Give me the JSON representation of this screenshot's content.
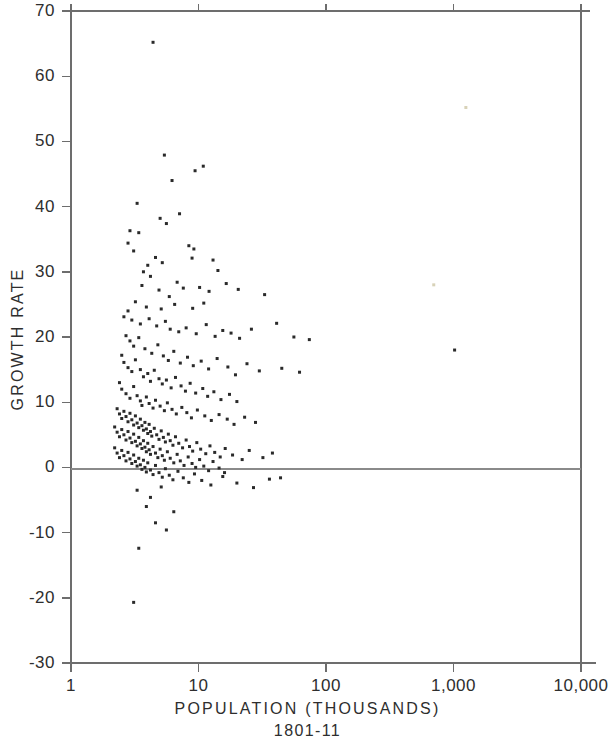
{
  "chart_data": {
    "type": "scatter",
    "title": "",
    "xlabel": "POPULATION  (THOUSANDS)",
    "xlabel_sub": "1801-11",
    "ylabel": "GROWTH  RATE",
    "x_scale": "log",
    "y_scale": "linear",
    "xlim": [
      1,
      10000
    ],
    "ylim": [
      -30,
      70
    ],
    "grid": false,
    "legend": null,
    "x_ticks": [
      1,
      10,
      100,
      1000,
      10000
    ],
    "x_tick_labels": [
      "1",
      "10",
      "100",
      "1,000",
      "10,000"
    ],
    "y_ticks": [
      -30,
      -20,
      -10,
      0,
      10,
      20,
      30,
      40,
      50,
      60,
      70
    ],
    "y_tick_labels": [
      "-30",
      "-20",
      "-10",
      "0",
      "10",
      "20",
      "30",
      "40",
      "50",
      "60",
      "70"
    ],
    "zero_reference_line": 0,
    "marker": "square-dot",
    "marker_size_px": 3,
    "marker_color": "#2a2a2a",
    "point_count": 268,
    "points": [
      [
        4.4,
        65.2
      ],
      [
        3.3,
        40.5
      ],
      [
        2.9,
        36.3
      ],
      [
        2.8,
        34.4
      ],
      [
        3.4,
        36.0
      ],
      [
        3.1,
        33.2
      ],
      [
        5.4,
        47.9
      ],
      [
        6.2,
        44.0
      ],
      [
        9.4,
        45.5
      ],
      [
        10.9,
        46.2
      ],
      [
        7.1,
        38.9
      ],
      [
        5.0,
        38.2
      ],
      [
        5.6,
        37.4
      ],
      [
        4.0,
        31.0
      ],
      [
        4.6,
        32.2
      ],
      [
        5.2,
        31.4
      ],
      [
        8.4,
        34.0
      ],
      [
        9.2,
        33.5
      ],
      [
        8.9,
        32.1
      ],
      [
        13.0,
        31.8
      ],
      [
        14.2,
        30.2
      ],
      [
        3.7,
        30.0
      ],
      [
        4.2,
        29.3
      ],
      [
        3.6,
        27.9
      ],
      [
        4.9,
        27.2
      ],
      [
        6.8,
        28.4
      ],
      [
        7.6,
        27.5
      ],
      [
        5.9,
        26.2
      ],
      [
        10.2,
        27.6
      ],
      [
        12.1,
        27.0
      ],
      [
        16.5,
        28.2
      ],
      [
        20.5,
        27.3
      ],
      [
        33.0,
        26.5
      ],
      [
        11.0,
        25.2
      ],
      [
        9.0,
        24.4
      ],
      [
        6.5,
        25.0
      ],
      [
        5.1,
        24.3
      ],
      [
        3.9,
        24.6
      ],
      [
        3.2,
        25.4
      ],
      [
        2.8,
        24.0
      ],
      [
        2.6,
        23.1
      ],
      [
        3.0,
        22.6
      ],
      [
        3.5,
        22.0
      ],
      [
        4.1,
        22.8
      ],
      [
        4.7,
        21.7
      ],
      [
        5.5,
        22.4
      ],
      [
        6.0,
        21.2
      ],
      [
        7.0,
        20.8
      ],
      [
        8.0,
        21.4
      ],
      [
        9.6,
        20.5
      ],
      [
        11.5,
        21.9
      ],
      [
        13.5,
        20.1
      ],
      [
        15.5,
        21.0
      ],
      [
        18.0,
        20.6
      ],
      [
        21.0,
        19.8
      ],
      [
        26.0,
        21.2
      ],
      [
        41.0,
        22.1
      ],
      [
        56.0,
        20.0
      ],
      [
        74.0,
        19.6
      ],
      [
        1020.0,
        18.0
      ],
      [
        2.7,
        20.2
      ],
      [
        2.9,
        19.4
      ],
      [
        3.1,
        18.6
      ],
      [
        3.4,
        19.9
      ],
      [
        3.8,
        18.2
      ],
      [
        4.3,
        17.5
      ],
      [
        4.8,
        18.8
      ],
      [
        5.3,
        17.1
      ],
      [
        5.8,
        16.4
      ],
      [
        6.4,
        17.8
      ],
      [
        7.2,
        16.0
      ],
      [
        8.2,
        16.9
      ],
      [
        9.1,
        15.6
      ],
      [
        10.5,
        16.3
      ],
      [
        12.0,
        15.1
      ],
      [
        14.0,
        16.7
      ],
      [
        17.0,
        15.4
      ],
      [
        19.5,
        14.2
      ],
      [
        24.0,
        15.9
      ],
      [
        30.0,
        14.8
      ],
      [
        45.0,
        15.2
      ],
      [
        62.0,
        14.6
      ],
      [
        2.5,
        17.2
      ],
      [
        2.6,
        16.1
      ],
      [
        2.8,
        15.3
      ],
      [
        3.0,
        14.7
      ],
      [
        3.2,
        16.5
      ],
      [
        3.5,
        15.0
      ],
      [
        3.7,
        13.9
      ],
      [
        4.0,
        14.4
      ],
      [
        4.2,
        13.2
      ],
      [
        4.5,
        14.9
      ],
      [
        4.9,
        13.6
      ],
      [
        5.2,
        12.8
      ],
      [
        5.6,
        13.4
      ],
      [
        6.1,
        12.2
      ],
      [
        6.6,
        13.8
      ],
      [
        7.3,
        12.5
      ],
      [
        7.9,
        11.7
      ],
      [
        8.6,
        12.9
      ],
      [
        9.5,
        11.4
      ],
      [
        10.8,
        12.1
      ],
      [
        11.8,
        10.9
      ],
      [
        13.2,
        11.6
      ],
      [
        15.0,
        10.4
      ],
      [
        17.5,
        11.2
      ],
      [
        20.0,
        10.1
      ],
      [
        2.4,
        13.0
      ],
      [
        2.5,
        12.0
      ],
      [
        2.7,
        11.3
      ],
      [
        2.9,
        10.6
      ],
      [
        3.1,
        12.4
      ],
      [
        3.3,
        11.0
      ],
      [
        3.5,
        10.2
      ],
      [
        3.6,
        9.5
      ],
      [
        3.9,
        10.8
      ],
      [
        4.1,
        9.8
      ],
      [
        4.4,
        9.1
      ],
      [
        4.6,
        10.3
      ],
      [
        5.0,
        9.4
      ],
      [
        5.4,
        8.7
      ],
      [
        5.7,
        9.9
      ],
      [
        6.2,
        8.9
      ],
      [
        6.7,
        8.2
      ],
      [
        7.4,
        9.2
      ],
      [
        8.1,
        8.4
      ],
      [
        8.8,
        7.6
      ],
      [
        9.8,
        8.8
      ],
      [
        11.2,
        7.9
      ],
      [
        12.6,
        7.2
      ],
      [
        14.5,
        8.1
      ],
      [
        16.8,
        7.4
      ],
      [
        19.0,
        6.6
      ],
      [
        23.0,
        7.7
      ],
      [
        28.0,
        6.9
      ],
      [
        2.3,
        9.0
      ],
      [
        2.4,
        8.2
      ],
      [
        2.5,
        7.5
      ],
      [
        2.6,
        8.6
      ],
      [
        2.7,
        7.8
      ],
      [
        2.8,
        7.0
      ],
      [
        2.9,
        8.3
      ],
      [
        3.0,
        7.3
      ],
      [
        3.1,
        6.5
      ],
      [
        3.2,
        7.9
      ],
      [
        3.3,
        6.8
      ],
      [
        3.4,
        6.1
      ],
      [
        3.5,
        7.4
      ],
      [
        3.6,
        6.4
      ],
      [
        3.7,
        5.7
      ],
      [
        3.8,
        6.9
      ],
      [
        3.9,
        5.9
      ],
      [
        4.0,
        5.2
      ],
      [
        4.1,
        6.6
      ],
      [
        4.2,
        5.5
      ],
      [
        4.3,
        4.8
      ],
      [
        4.5,
        6.0
      ],
      [
        4.7,
        5.0
      ],
      [
        4.9,
        4.3
      ],
      [
        5.1,
        5.6
      ],
      [
        5.3,
        4.6
      ],
      [
        5.5,
        3.9
      ],
      [
        5.8,
        5.1
      ],
      [
        6.0,
        4.1
      ],
      [
        6.3,
        3.4
      ],
      [
        6.6,
        4.7
      ],
      [
        7.0,
        3.7
      ],
      [
        7.5,
        3.0
      ],
      [
        8.0,
        4.2
      ],
      [
        8.5,
        3.2
      ],
      [
        9.0,
        2.5
      ],
      [
        9.7,
        3.8
      ],
      [
        10.4,
        2.8
      ],
      [
        11.4,
        2.1
      ],
      [
        12.3,
        3.3
      ],
      [
        13.4,
        2.3
      ],
      [
        14.8,
        1.6
      ],
      [
        16.2,
        2.9
      ],
      [
        18.5,
        1.9
      ],
      [
        22.0,
        1.2
      ],
      [
        25.0,
        2.6
      ],
      [
        32.0,
        1.5
      ],
      [
        38.0,
        2.2
      ],
      [
        2.2,
        6.2
      ],
      [
        2.3,
        5.4
      ],
      [
        2.4,
        4.7
      ],
      [
        2.5,
        5.8
      ],
      [
        2.6,
        5.0
      ],
      [
        2.7,
        4.2
      ],
      [
        2.8,
        5.5
      ],
      [
        2.9,
        4.5
      ],
      [
        3.0,
        3.8
      ],
      [
        3.1,
        5.1
      ],
      [
        3.2,
        4.0
      ],
      [
        3.3,
        3.3
      ],
      [
        3.4,
        4.6
      ],
      [
        3.5,
        3.6
      ],
      [
        3.6,
        2.9
      ],
      [
        3.7,
        4.1
      ],
      [
        3.8,
        3.1
      ],
      [
        3.9,
        2.4
      ],
      [
        4.0,
        3.7
      ],
      [
        4.1,
        2.7
      ],
      [
        4.2,
        2.0
      ],
      [
        4.4,
        3.2
      ],
      [
        4.6,
        2.2
      ],
      [
        4.8,
        1.5
      ],
      [
        5.0,
        2.8
      ],
      [
        5.2,
        1.8
      ],
      [
        5.4,
        1.1
      ],
      [
        5.7,
        2.4
      ],
      [
        6.0,
        1.4
      ],
      [
        6.4,
        0.7
      ],
      [
        6.8,
        2.0
      ],
      [
        7.2,
        1.0
      ],
      [
        7.7,
        0.3
      ],
      [
        8.3,
        1.6
      ],
      [
        8.9,
        0.6
      ],
      [
        9.5,
        0.0
      ],
      [
        10.2,
        1.2
      ],
      [
        11.0,
        0.2
      ],
      [
        12.0,
        -0.5
      ],
      [
        13.0,
        0.9
      ],
      [
        14.5,
        -0.1
      ],
      [
        16.0,
        -0.8
      ],
      [
        2.2,
        3.0
      ],
      [
        2.3,
        2.2
      ],
      [
        2.4,
        1.5
      ],
      [
        2.5,
        2.6
      ],
      [
        2.6,
        1.8
      ],
      [
        2.7,
        1.0
      ],
      [
        2.8,
        2.3
      ],
      [
        2.9,
        1.3
      ],
      [
        3.0,
        0.6
      ],
      [
        3.1,
        1.9
      ],
      [
        3.2,
        0.9
      ],
      [
        3.3,
        0.2
      ],
      [
        3.4,
        1.4
      ],
      [
        3.5,
        0.4
      ],
      [
        3.6,
        -0.3
      ],
      [
        3.7,
        1.1
      ],
      [
        3.8,
        0.0
      ],
      [
        3.9,
        -0.7
      ],
      [
        4.0,
        0.7
      ],
      [
        4.2,
        -0.4
      ],
      [
        4.4,
        -1.1
      ],
      [
        4.6,
        0.3
      ],
      [
        4.9,
        -0.8
      ],
      [
        5.2,
        -1.5
      ],
      [
        5.5,
        -0.2
      ],
      [
        5.9,
        -1.2
      ],
      [
        6.3,
        -1.9
      ],
      [
        6.9,
        -0.6
      ],
      [
        7.6,
        -1.6
      ],
      [
        8.4,
        -2.3
      ],
      [
        9.3,
        -1.0
      ],
      [
        10.6,
        -2.0
      ],
      [
        12.5,
        -2.7
      ],
      [
        15.5,
        -1.4
      ],
      [
        20.0,
        -2.4
      ],
      [
        27.0,
        -3.1
      ],
      [
        36.0,
        -1.8
      ],
      [
        44.0,
        -1.6
      ],
      [
        3.3,
        -3.5
      ],
      [
        4.2,
        -4.6
      ],
      [
        5.1,
        -3.0
      ],
      [
        3.9,
        -6.0
      ],
      [
        6.4,
        -6.8
      ],
      [
        4.6,
        -8.5
      ],
      [
        5.6,
        -9.6
      ],
      [
        3.4,
        -12.4
      ],
      [
        3.1,
        -20.7
      ],
      [
        700.0,
        28.0
      ],
      [
        1250.0,
        55.2
      ]
    ]
  },
  "axes": {
    "y_axis_name": "GROWTH  RATE",
    "x_axis_name": "POPULATION  (THOUSANDS)",
    "period": "1801-11"
  },
  "style": {
    "axis_color": "#6d6d6d",
    "point_color": "#2a2a2a",
    "background": "#ffffff"
  }
}
